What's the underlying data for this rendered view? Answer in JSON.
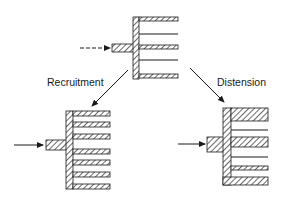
{
  "diagram": {
    "labels": {
      "recruitment": "Recruitment",
      "distension": "Distension"
    },
    "colors": {
      "stroke": "#1a1a1a",
      "background": "#ffffff"
    },
    "panels": [
      {
        "id": "baseline",
        "description": "Baseline vessel network with open and closed channels"
      },
      {
        "id": "recruitment",
        "description": "Recruitment: previously closed channels open"
      },
      {
        "id": "distension",
        "description": "Distension: existing channels widen"
      }
    ]
  }
}
